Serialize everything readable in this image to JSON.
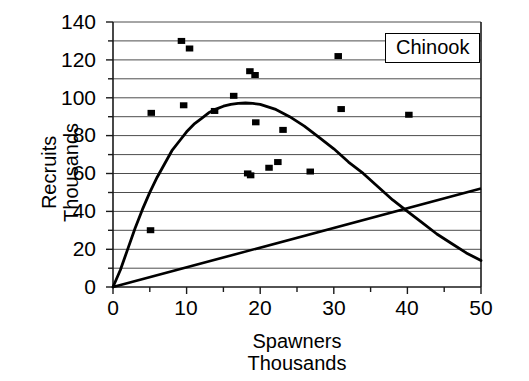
{
  "chart_data": {
    "type": "scatter",
    "title": "",
    "legend_label": "Chinook",
    "legend_position": "top-right-inside",
    "xlabel": "Spawners",
    "xlabel_sub": "Thousands",
    "ylabel": "Recruits",
    "ylabel_sub": "Thousands",
    "xlim": [
      0,
      50
    ],
    "ylim": [
      0,
      140
    ],
    "x_ticks": [
      0,
      10,
      20,
      30,
      40,
      50
    ],
    "x_minor_ticks": [
      5,
      15,
      25,
      35,
      45
    ],
    "y_ticks": [
      0,
      20,
      40,
      60,
      80,
      100,
      120,
      140
    ],
    "grid": "horizontal-major-and-minor",
    "grid_values": [
      10,
      20,
      30,
      40,
      50,
      60,
      70,
      80,
      90,
      100,
      110,
      120,
      130,
      140
    ],
    "marker": "square",
    "marker_color": "#000000",
    "series": [
      {
        "name": "Observations",
        "type": "scatter",
        "points": [
          {
            "x": 5.1,
            "y": 30
          },
          {
            "x": 5.2,
            "y": 92
          },
          {
            "x": 9.3,
            "y": 130
          },
          {
            "x": 10.4,
            "y": 126
          },
          {
            "x": 9.6,
            "y": 96
          },
          {
            "x": 13.8,
            "y": 93
          },
          {
            "x": 16.4,
            "y": 101
          },
          {
            "x": 18.6,
            "y": 114
          },
          {
            "x": 19.3,
            "y": 112
          },
          {
            "x": 18.3,
            "y": 60
          },
          {
            "x": 18.7,
            "y": 59
          },
          {
            "x": 19.4,
            "y": 87
          },
          {
            "x": 21.2,
            "y": 63
          },
          {
            "x": 22.4,
            "y": 66
          },
          {
            "x": 23.1,
            "y": 83
          },
          {
            "x": 26.8,
            "y": 61
          },
          {
            "x": 30.6,
            "y": 122
          },
          {
            "x": 31.0,
            "y": 94
          },
          {
            "x": 40.2,
            "y": 91
          }
        ]
      },
      {
        "name": "Ricker stock-recruit curve",
        "type": "line",
        "color": "#000000",
        "points": [
          {
            "x": 0,
            "y": 0
          },
          {
            "x": 1,
            "y": 9
          },
          {
            "x": 2,
            "y": 20
          },
          {
            "x": 3,
            "y": 31
          },
          {
            "x": 4,
            "y": 41
          },
          {
            "x": 5,
            "y": 50
          },
          {
            "x": 6,
            "y": 58
          },
          {
            "x": 7,
            "y": 65
          },
          {
            "x": 8,
            "y": 72
          },
          {
            "x": 9,
            "y": 77
          },
          {
            "x": 10,
            "y": 82
          },
          {
            "x": 11,
            "y": 86
          },
          {
            "x": 12,
            "y": 89
          },
          {
            "x": 13,
            "y": 92
          },
          {
            "x": 14,
            "y": 94
          },
          {
            "x": 15,
            "y": 95.5
          },
          {
            "x": 16,
            "y": 96.5
          },
          {
            "x": 17,
            "y": 97
          },
          {
            "x": 18,
            "y": 97.2
          },
          {
            "x": 19,
            "y": 97
          },
          {
            "x": 20,
            "y": 96.5
          },
          {
            "x": 22,
            "y": 94
          },
          {
            "x": 24,
            "y": 90
          },
          {
            "x": 26,
            "y": 85
          },
          {
            "x": 28,
            "y": 79
          },
          {
            "x": 30,
            "y": 73
          },
          {
            "x": 32,
            "y": 66
          },
          {
            "x": 34,
            "y": 60
          },
          {
            "x": 36,
            "y": 53
          },
          {
            "x": 38,
            "y": 46
          },
          {
            "x": 40,
            "y": 40
          },
          {
            "x": 42,
            "y": 34
          },
          {
            "x": 44,
            "y": 28
          },
          {
            "x": 46,
            "y": 23
          },
          {
            "x": 48,
            "y": 18
          },
          {
            "x": 50,
            "y": 14
          }
        ]
      },
      {
        "name": "Replacement line",
        "type": "line",
        "color": "#000000",
        "points": [
          {
            "x": 0,
            "y": 0
          },
          {
            "x": 50,
            "y": 52
          }
        ]
      }
    ]
  },
  "axis": {
    "y_tick_labels": [
      "140",
      "120",
      "100",
      "80",
      "60",
      "40",
      "20",
      "0"
    ],
    "x_tick_labels": [
      "0",
      "10",
      "20",
      "30",
      "40",
      "50"
    ]
  },
  "labels": {
    "y_title_line1": "Recruits",
    "y_title_line2": "Thousands",
    "x_title_line1": "Spawners",
    "x_title_line2": "Thousands",
    "legend": "Chinook"
  }
}
